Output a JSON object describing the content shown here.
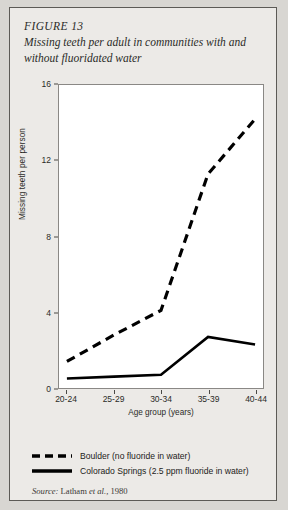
{
  "figure": {
    "number": "FIGURE 13",
    "title": "Missing teeth per adult in communities with and without fluoridated water",
    "source_prefix": "Source:",
    "source_author": "Latham",
    "source_etal": "et al.,",
    "source_year": "1980"
  },
  "legend": {
    "items": [
      {
        "label": "Boulder (no fluoride in water)",
        "style": "dashed",
        "color": "#000000"
      },
      {
        "label": "Colorado Springs (2.5 ppm fluoride in water)",
        "style": "solid",
        "color": "#000000"
      }
    ]
  },
  "chart_data": {
    "type": "line",
    "title": "Missing teeth per adult in communities with and without fluoridated water",
    "xlabel": "Age group (years)",
    "ylabel": "Missing teeth per person",
    "categories": [
      "20-24",
      "25-29",
      "30-34",
      "35-39",
      "40-44"
    ],
    "yticks": [
      0,
      4,
      8,
      12,
      16
    ],
    "ylim": [
      0,
      16
    ],
    "grid": false,
    "legend_position": "below",
    "series": [
      {
        "name": "Boulder (no fluoride in water)",
        "style": "dashed",
        "color": "#000000",
        "values": [
          1.4,
          2.8,
          4.1,
          11.3,
          14.2
        ]
      },
      {
        "name": "Colorado Springs (2.5 ppm fluoride in water)",
        "style": "solid",
        "color": "#000000",
        "values": [
          0.5,
          0.6,
          0.7,
          2.7,
          2.3
        ]
      }
    ]
  }
}
